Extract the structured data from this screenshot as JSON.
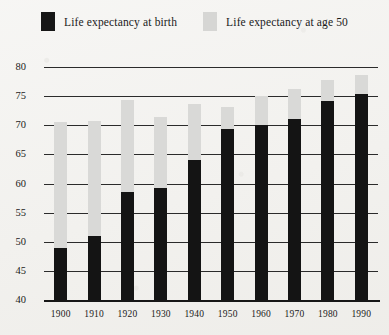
{
  "legend": {
    "entries": [
      {
        "label": "Life expectancy at birth",
        "swatch": "dark-swatch",
        "color": "#161616"
      },
      {
        "label": "Life expectancy at age 50",
        "swatch": "light-swatch",
        "color": "#d6d6d4"
      }
    ]
  },
  "chart_data": {
    "type": "bar",
    "title": "",
    "xlabel": "",
    "ylabel": "",
    "ylim": [
      40,
      80
    ],
    "yticks": [
      40,
      45,
      50,
      55,
      60,
      65,
      70,
      75,
      80
    ],
    "grid": true,
    "legend_position": "top-center",
    "categories": [
      "1900",
      "1910",
      "1920",
      "1930",
      "1940",
      "1950",
      "1960",
      "1970",
      "1980",
      "1990"
    ],
    "series": [
      {
        "name": "Life expectancy at birth",
        "color": "#141414",
        "values": [
          49.0,
          51.0,
          58.5,
          59.3,
          64.0,
          69.4,
          70.0,
          71.1,
          74.1,
          75.3
        ]
      },
      {
        "name": "Life expectancy at age 50",
        "color": "#d9d9d7",
        "values": [
          70.6,
          70.7,
          74.3,
          71.4,
          73.7,
          73.2,
          75.0,
          76.3,
          77.7,
          78.7
        ]
      }
    ]
  }
}
